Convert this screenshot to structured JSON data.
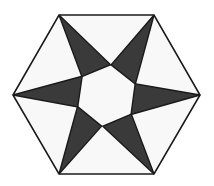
{
  "figure": {
    "title": "Six-pointed pinwheel star inscribed in a regular hexagon",
    "canvas": {
      "width": 214,
      "height": 186,
      "background": "#ffffff"
    },
    "colors": {
      "page_background": "#ffffff",
      "hexagon_fill": "#f8f8f8",
      "hexagon_stroke": "#1a1a1a",
      "star_fill": "#3a3a3a",
      "star_stroke": "#1a1a1a"
    },
    "hexagon": {
      "name": "regular-hexagon",
      "center": {
        "x": 106.5,
        "y": 94.5
      },
      "circumradius": 94,
      "orientation": "flat-top",
      "stroke_width": 1.6,
      "vertices": [
        {
          "label": "top-left",
          "x": 59,
          "y": 15
        },
        {
          "label": "top-right",
          "x": 154,
          "y": 15
        },
        {
          "label": "right",
          "x": 200,
          "y": 95
        },
        {
          "label": "bottom-right",
          "x": 154,
          "y": 174
        },
        {
          "label": "bottom-left",
          "x": 59,
          "y": 174
        },
        {
          "label": "left",
          "x": 13,
          "y": 95
        }
      ]
    },
    "star": {
      "name": "six-arm-pinwheel",
      "arm_count": 6,
      "rotation_sense": "clockwise",
      "center": {
        "x": 106.5,
        "y": 95.5
      },
      "hub_radius": 31,
      "hub_offset_degrees": 22,
      "stroke_width": 1.4,
      "arms": [
        {
          "label": "arm-top-left",
          "tip_x": 59,
          "tip_y": 15
        },
        {
          "label": "arm-top-right",
          "tip_x": 154,
          "tip_y": 15
        },
        {
          "label": "arm-right",
          "tip_x": 200,
          "tip_y": 95
        },
        {
          "label": "arm-bottom-right",
          "tip_x": 154,
          "tip_y": 174
        },
        {
          "label": "arm-bottom-left",
          "tip_x": 59,
          "tip_y": 174
        },
        {
          "label": "arm-left",
          "tip_x": 13,
          "tip_y": 95
        }
      ]
    }
  }
}
